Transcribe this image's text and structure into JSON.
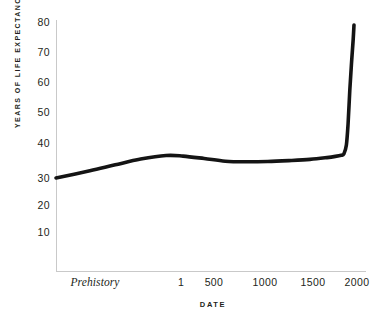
{
  "chart_data": {
    "type": "line",
    "title": "",
    "xlabel": "DATE",
    "ylabel": "YEARS OF LIFE EXPECTANCY",
    "grid": false,
    "legend": "none",
    "xlim": [
      -1500,
      2150
    ],
    "ylim": [
      0,
      85
    ],
    "y_ticks": [
      10,
      20,
      30,
      40,
      50,
      60,
      70,
      80
    ],
    "y_tick_labels": [
      "10",
      "20",
      "30",
      "40",
      "50",
      "60",
      "70",
      "80"
    ],
    "x_ticks": [
      -1400,
      1,
      500,
      1000,
      1500,
      2000
    ],
    "x_tick_labels": [
      "Prehistory",
      "1",
      "500",
      "1000",
      "1500",
      "2000"
    ],
    "series": [
      {
        "name": "Life expectancy",
        "color": "#141414",
        "x": [
          -1500,
          -1100,
          -800,
          -500,
          -200,
          1,
          250,
          500,
          750,
          1000,
          1250,
          1500,
          1700,
          1800,
          1870,
          1900,
          1930,
          1950,
          1970,
          1990,
          2010,
          2020
        ],
        "values": [
          30,
          32.4,
          34.4,
          36.3,
          37.5,
          37.3,
          36.5,
          35.6,
          35.4,
          35.5,
          35.8,
          36.2,
          36.8,
          37.2,
          37.6,
          38,
          41,
          48,
          59,
          68,
          76,
          81
        ]
      }
    ]
  },
  "axis": {
    "y_title": "YEARS OF LIFE EXPECTANCY",
    "x_title": "DATE",
    "y_labels": [
      {
        "text": "80",
        "top": 17
      },
      {
        "text": "70",
        "top": 47
      },
      {
        "text": "60",
        "top": 77
      },
      {
        "text": "50",
        "top": 107
      },
      {
        "text": "40",
        "top": 142
      },
      {
        "text": "30",
        "top": 173
      },
      {
        "text": "20",
        "top": 200
      },
      {
        "text": "10",
        "top": 226
      }
    ],
    "x_labels": [
      {
        "text": "Prehistory",
        "left": 95,
        "italic": true
      },
      {
        "text": "1",
        "left": 181,
        "italic": false
      },
      {
        "text": "500",
        "left": 214,
        "italic": false
      },
      {
        "text": "1000",
        "left": 265,
        "italic": false
      },
      {
        "text": "1500",
        "left": 313,
        "italic": false
      },
      {
        "text": "2000",
        "left": 357,
        "italic": false
      }
    ]
  },
  "style": {
    "line_color": "#141414",
    "axis_color": "#c9c9c9",
    "text_color": "#231f20",
    "background": "#ffffff"
  }
}
